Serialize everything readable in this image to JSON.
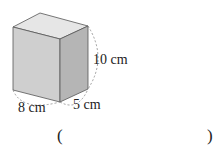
{
  "figure": {
    "shape": "rectangular-prism",
    "dimensions": {
      "length": "8 cm",
      "width": "5 cm",
      "height": "10 cm"
    },
    "colors": {
      "front": "#cfcfcf",
      "top": "#e6e6e6",
      "side": "#b5b5b5",
      "edge": "#555555",
      "dash": "#888888"
    }
  },
  "answer": {
    "open_paren": "(",
    "close_paren": ")",
    "value": ""
  }
}
